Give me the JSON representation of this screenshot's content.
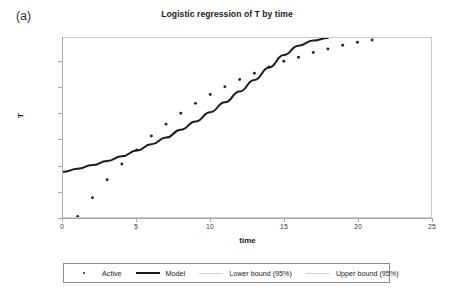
{
  "panel": {
    "label": "(a)"
  },
  "chart_data": {
    "type": "scatter",
    "title": "Logistic regression of T by time",
    "xlabel": "time",
    "ylabel": "T",
    "xlim": [
      0,
      25
    ],
    "ylim": [
      0,
      345
    ],
    "xticks": [
      0,
      5,
      10,
      15,
      20,
      25
    ],
    "yticks": [
      0,
      50,
      100,
      150,
      200,
      250,
      300
    ],
    "grid": false,
    "legend_position": "bottom",
    "series": [
      {
        "name": "Active",
        "type": "scatter",
        "marker": "dot",
        "color": "#2b2b2b",
        "x": [
          1,
          2,
          3,
          4,
          5,
          6,
          7,
          8,
          9,
          10,
          11,
          12,
          13,
          14,
          15,
          16,
          17,
          18,
          19,
          20,
          21
        ],
        "values": [
          1,
          37,
          72,
          102,
          129,
          156,
          179,
          200,
          219,
          236,
          251,
          265,
          277,
          289,
          300,
          308,
          317,
          324,
          331,
          337,
          341
        ]
      },
      {
        "name": "Model",
        "type": "line",
        "color": "#1b1b1b",
        "width": 2,
        "x": [
          0,
          1,
          2,
          3,
          4,
          5,
          6,
          7,
          8,
          9,
          10,
          11,
          12,
          13,
          14,
          15,
          16,
          17,
          18
        ],
        "values": [
          87,
          93,
          100,
          108,
          117,
          128,
          140,
          153,
          168,
          184,
          202,
          221,
          242,
          264,
          288,
          312,
          330,
          340,
          345
        ]
      },
      {
        "name": "Lower bound (95%)",
        "type": "line",
        "color": "#d2d2d2",
        "width": 1,
        "x": [],
        "values": []
      },
      {
        "name": "Upper bound (95%)",
        "type": "line",
        "color": "#d2d2d2",
        "width": 1,
        "x": [],
        "values": []
      }
    ]
  },
  "legend": {
    "entries": [
      {
        "label": "Active",
        "key": "marker",
        "color": "#2b2b2b"
      },
      {
        "label": "Model",
        "key": "thick-line",
        "color": "#1b1b1b"
      },
      {
        "label": "Lower bound (95%)",
        "key": "thin-line",
        "color": "#d2d2d2"
      },
      {
        "label": "Upper bound (95%)",
        "key": "thin-line",
        "color": "#d2d2d2"
      }
    ]
  }
}
